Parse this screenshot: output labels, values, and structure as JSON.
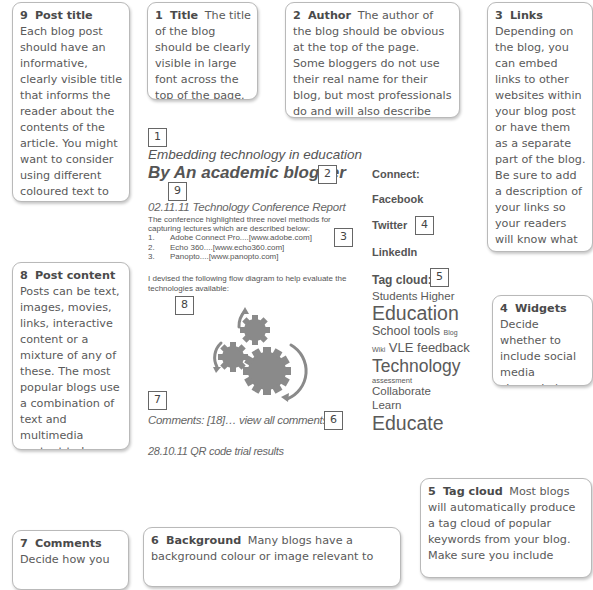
{
  "callouts": {
    "post_title": {
      "number": "9",
      "heading": "Post title",
      "text": "Each blog post should have an informative, clearly visible title that informs the reader about the contents of the article. You might want to consider using different coloured text to make the title stand out from the background."
    },
    "title": {
      "number": "1",
      "heading": "Title",
      "text": "The title of the blog should be clearly visible in large font across the top of the page."
    },
    "author": {
      "number": "2",
      "heading": "Author",
      "text": "The author of the blog should be obvious at the top of the page. Some bloggers do not use their real name for their blog, but most professionals do and will also describe their affiliation (e.g., place of work)."
    },
    "links": {
      "number": "3",
      "heading": "Links",
      "text": "Depending on the blog, you can embed links to other websites within your blog post or have them as a separate part of the blog.  Be sure to add a description of your links so your readers will know what they are linking to."
    },
    "post_content": {
      "number": "8",
      "heading": "Post content",
      "text": "Posts can be text, images, movies, links, interactive content or a mixture of any of these. The most popular blogs use a combination of text and multimedia content to keep readers interested."
    },
    "widgets": {
      "number": "4",
      "heading": "Widgets",
      "text": "Decide whether to include social media channels (e.g., Twitter feed) on your blog page."
    },
    "tag_cloud": {
      "number": "5",
      "heading": "Tag cloud",
      "text": "Most blogs will automatically produce a tag cloud of popular keywords from your blog. Make sure you include"
    },
    "comments": {
      "number": "7",
      "heading": "Comments",
      "text": "Decide how you"
    },
    "background": {
      "number": "6",
      "heading": "Background",
      "text": "Many blogs have a background colour or image relevant to"
    }
  },
  "blog": {
    "title": "Embedding technology in education",
    "author": "By An academic blogger",
    "post": {
      "heading": "02.11.11 Technology Conference Report",
      "intro": "The conference highlighted three novel methods for capturing lectures which are described below:",
      "links": [
        {
          "index": "1.",
          "text": "Adobe Connect Pro....[www.adobe.com]"
        },
        {
          "index": "2.",
          "text": "Echo 360....[www.echo360.com]"
        },
        {
          "index": "3.",
          "text": "Panopto....[www.panopto.com]"
        }
      ],
      "diagram_intro": "I devised the following flow diagram to help evaluate the technologies available:",
      "comments": "Comments: [18]… view all comments"
    },
    "next_post": "28.10.11 QR code trial results",
    "sidebar": {
      "connect_label": "Connect:",
      "social": [
        "Facebook",
        "Twitter",
        "LinkedIn"
      ],
      "tag_cloud_label": "Tag cloud:",
      "tags": [
        {
          "text": "Students",
          "size": 12
        },
        {
          "text": "Higher",
          "size": 12
        },
        {
          "text": "Education",
          "size": 20
        },
        {
          "text": "School",
          "size": 12.5
        },
        {
          "text": "tools",
          "size": 12.5
        },
        {
          "text": "Blog",
          "size": 7
        },
        {
          "text": "Wiki",
          "size": 7
        },
        {
          "text": "VLE",
          "size": 13
        },
        {
          "text": "feedback",
          "size": 13
        },
        {
          "text": "Technology",
          "size": 18
        },
        {
          "text": "assessment",
          "size": 7.5
        },
        {
          "text": "Collaborate",
          "size": 12
        },
        {
          "text": "Learn",
          "size": 12
        },
        {
          "text": "Educate",
          "size": 22
        }
      ]
    }
  },
  "markers": {
    "m1": "1",
    "m2": "2",
    "m3": "3",
    "m4": "4",
    "m5": "5",
    "m6": "6",
    "m7": "7",
    "m8": "8",
    "m9": "9"
  },
  "icons": {
    "diagram": "gears-icon"
  }
}
